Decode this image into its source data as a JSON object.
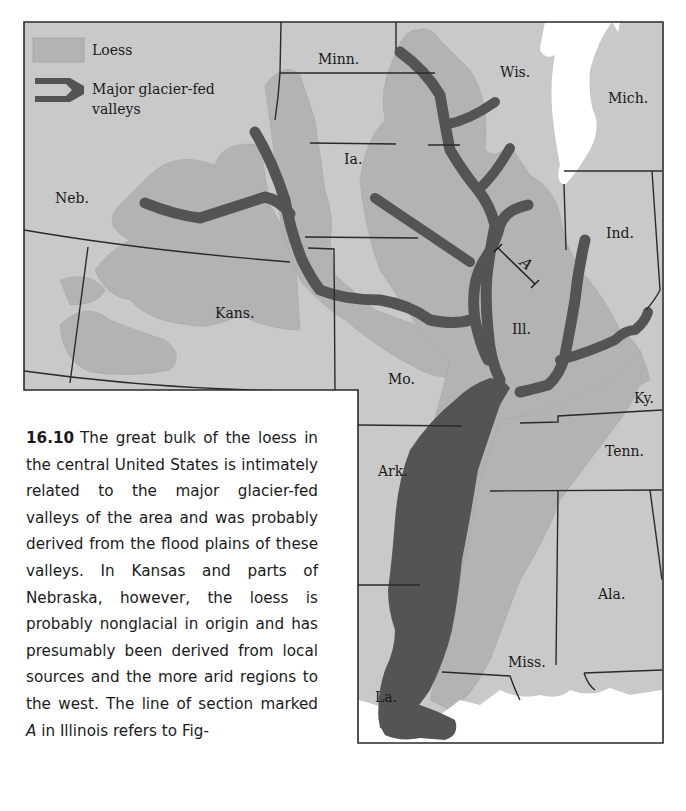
{
  "figure": {
    "number": "16.10",
    "caption_parts": [
      "The great bulk of the loess in the central United States is intimately related to the major glacier-fed valleys of the area and was probably derived from the flood plains of these valleys. In Kansas and parts of Nebraska, however, the loess is probably nonglacial in origin and has presumably been derived from local sources and the more arid regions to the west. The line of section marked ",
      "A",
      " in Illinois refers to Fig-"
    ]
  },
  "legend": {
    "items": [
      {
        "label": "Loess",
        "symbol": "light-gray-patch"
      },
      {
        "label_line1": "Major glacier-fed",
        "label_line2": "valleys",
        "symbol": "dark-branching-band"
      }
    ]
  },
  "map": {
    "states": {
      "minn": "Minn.",
      "wis": "Wis.",
      "mich": "Mich.",
      "neb": "Neb.",
      "ia": "Ia.",
      "ind": "Ind.",
      "kans": "Kans.",
      "ill": "Ill.",
      "mo": "Mo.",
      "ky": "Ky.",
      "tenn": "Tenn.",
      "ark": "Ark.",
      "ala": "Ala.",
      "miss": "Miss.",
      "la": "La."
    },
    "section_line_label": "A",
    "colors": {
      "land": "#c9c9c9",
      "loess": "#b3b3b3",
      "valleys": "#545454",
      "water": "#ffffff",
      "border": "#2a2a2a"
    }
  }
}
